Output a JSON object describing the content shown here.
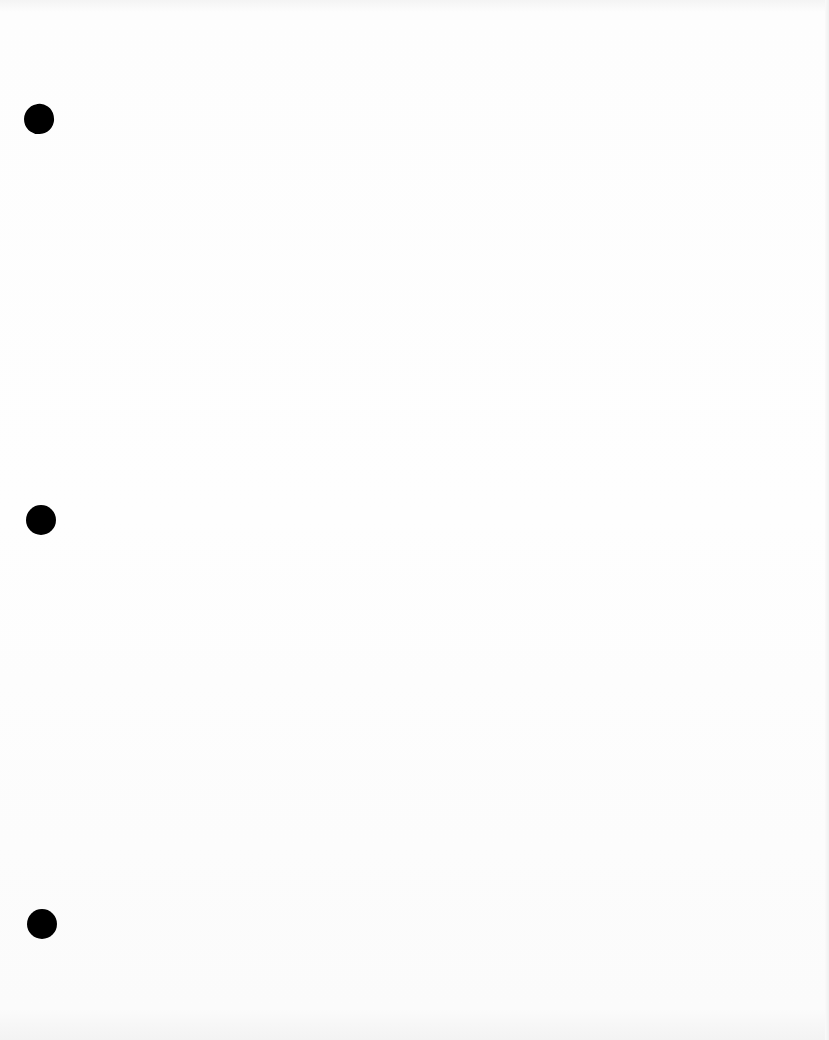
{
  "document": {
    "type": "blank scanned page",
    "punch_holes": [
      {
        "x": 24,
        "y": 104,
        "size": 30
      },
      {
        "x": 26,
        "y": 505,
        "size": 30
      },
      {
        "x": 27,
        "y": 909,
        "size": 30
      }
    ],
    "colors": {
      "paper": "#fdfdfd",
      "hole": "#000000"
    }
  }
}
